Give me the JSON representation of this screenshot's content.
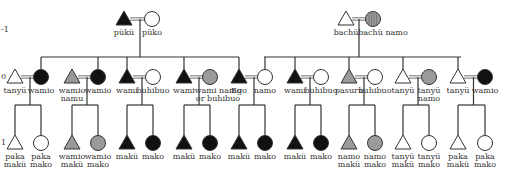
{
  "generations": [
    {
      "label": "-1",
      "y": 30
    },
    {
      "label": "0",
      "y": 77
    },
    {
      "label": "1",
      "y": 143
    }
  ],
  "colors": {
    "black": "#111111",
    "gray": "#9a9a9a",
    "white": "#ffffff",
    "line": "#333333",
    "marriage": "#888888"
  },
  "top_couples": [
    {
      "husband": {
        "shape": "triangle",
        "fill": "black",
        "label": "pükü",
        "x": 124
      },
      "wife": {
        "shape": "circle",
        "fill": "white",
        "label": "püko",
        "x": 152
      },
      "drop_x": 140,
      "siblings_span": [
        41,
        239
      ]
    },
    {
      "husband": {
        "shape": "triangle",
        "fill": "white",
        "label": "bachü",
        "x": 346
      },
      "wife": {
        "shape": "circle",
        "fill": "striped",
        "label": "bachü namo",
        "x": 373
      },
      "drop_x": 359,
      "siblings_span": [
        264,
        461
      ]
    }
  ],
  "gen0_couples": [
    {
      "husband": {
        "fill": "white",
        "label": "tanyü",
        "x": 15
      },
      "wife": {
        "fill": "black",
        "label": "wamio",
        "x": 41
      },
      "link": "wife",
      "children": [
        {
          "shape": "triangle",
          "fill": "white",
          "label": [
            "paka",
            "makü"
          ]
        },
        {
          "shape": "circle",
          "fill": "white",
          "label": [
            "paka",
            "mako"
          ]
        }
      ]
    },
    {
      "husband": {
        "fill": "gray",
        "label": "wamio namu",
        "x": 72
      },
      "wife": {
        "fill": "black",
        "label": "wamio",
        "x": 98
      },
      "link": "wife",
      "children": [
        {
          "shape": "triangle",
          "fill": "gray",
          "label": [
            "wamio",
            "makü"
          ]
        },
        {
          "shape": "circle",
          "fill": "gray",
          "label": [
            "wamio",
            "mako"
          ]
        }
      ]
    },
    {
      "husband": {
        "fill": "black",
        "label": "wami",
        "x": 127
      },
      "wife": {
        "fill": "white",
        "label": "buhibuo",
        "x": 153
      },
      "link": "husband",
      "children": [
        {
          "shape": "triangle",
          "fill": "black",
          "label": [
            "makü"
          ]
        },
        {
          "shape": "circle",
          "fill": "black",
          "label": [
            "mako"
          ]
        }
      ]
    },
    {
      "husband": {
        "fill": "black",
        "label": "wami",
        "x": 184
      },
      "wife": {
        "fill": "gray",
        "label": "wami namo or buhibuo",
        "x": 210
      },
      "link": "husband",
      "children": [
        {
          "shape": "triangle",
          "fill": "black",
          "label": [
            "makü"
          ]
        },
        {
          "shape": "circle",
          "fill": "black",
          "label": [
            "mako"
          ]
        }
      ]
    },
    {
      "husband": {
        "fill": "black",
        "label": "Ego",
        "x": 239
      },
      "wife": {
        "fill": "white",
        "label": "namo",
        "x": 265
      },
      "link": "both",
      "children": [
        {
          "shape": "triangle",
          "fill": "black",
          "label": [
            "makü"
          ]
        },
        {
          "shape": "circle",
          "fill": "black",
          "label": [
            "mako"
          ]
        }
      ]
    },
    {
      "husband": {
        "fill": "black",
        "label": "wami",
        "x": 295
      },
      "wife": {
        "fill": "white",
        "label": "buhibuo",
        "x": 321
      },
      "link": "wife",
      "children": [
        {
          "shape": "triangle",
          "fill": "black",
          "label": [
            "makü"
          ]
        },
        {
          "shape": "circle",
          "fill": "black",
          "label": [
            "mako"
          ]
        }
      ]
    },
    {
      "husband": {
        "fill": "gray",
        "label": "pasuru",
        "x": 349
      },
      "wife": {
        "fill": "white",
        "label": "buhibuo",
        "x": 375
      },
      "link": "wife",
      "children": [
        {
          "shape": "triangle",
          "fill": "gray",
          "label": [
            "namo",
            "makü"
          ]
        },
        {
          "shape": "circle",
          "fill": "gray",
          "label": [
            "namo",
            "mako"
          ]
        }
      ]
    },
    {
      "husband": {
        "fill": "white",
        "label": "tanyü",
        "x": 403
      },
      "wife": {
        "fill": "gray",
        "label": "tanyü namo",
        "x": 429
      },
      "link": "husband",
      "children": [
        {
          "shape": "triangle",
          "fill": "white",
          "label": [
            "tanyü",
            "makü"
          ]
        },
        {
          "shape": "circle",
          "fill": "white",
          "label": [
            "tanyü",
            "mako"
          ]
        }
      ]
    },
    {
      "husband": {
        "fill": "white",
        "label": "tanyü",
        "x": 458
      },
      "wife": {
        "fill": "black",
        "label": "wamio",
        "x": 485
      },
      "link": "husband",
      "children": [
        {
          "shape": "triangle",
          "fill": "white",
          "label": [
            "paka",
            "makü"
          ]
        },
        {
          "shape": "circle",
          "fill": "white",
          "label": [
            "paka",
            "mako"
          ]
        }
      ]
    }
  ]
}
